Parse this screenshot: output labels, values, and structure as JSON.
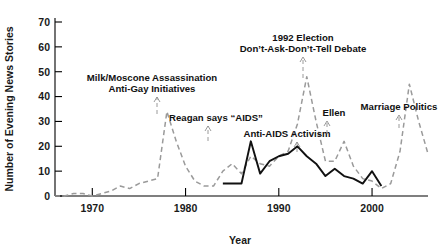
{
  "chart_data": {
    "type": "line",
    "title": "",
    "xlabel": "Year",
    "ylabel": "Number of Evening News Stories",
    "xlim": [
      1966,
      2006
    ],
    "ylim": [
      0,
      70
    ],
    "grid": false,
    "legend_position": "none",
    "x_ticks": [
      1970,
      1980,
      1990,
      2000
    ],
    "x_tick_labels": [
      "1970",
      "1980",
      "1990",
      "2000"
    ],
    "y_ticks": [
      0,
      10,
      20,
      30,
      40,
      50,
      60,
      70
    ],
    "y_tick_labels": [
      "0",
      "10",
      "20",
      "30",
      "40",
      "50",
      "60",
      "70"
    ],
    "series": [
      {
        "name": "Gay rights / general coverage",
        "style": "dashed",
        "color": "#9a9a9a",
        "x": [
          1966,
          1967,
          1968,
          1969,
          1970,
          1971,
          1972,
          1973,
          1974,
          1975,
          1976,
          1977,
          1978,
          1979,
          1980,
          1981,
          1982,
          1983,
          1984,
          1985,
          1986,
          1987,
          1988,
          1989,
          1990,
          1991,
          1992,
          1993,
          1994,
          1995,
          1996,
          1997,
          1998,
          1999,
          2000,
          2001,
          2002,
          2003,
          2004,
          2005,
          2006
        ],
        "y": [
          0,
          0,
          1,
          1,
          0,
          1,
          2,
          4,
          3,
          5,
          6,
          7,
          34,
          22,
          12,
          6,
          4,
          4,
          10,
          13,
          9,
          16,
          13,
          12,
          16,
          18,
          29,
          48,
          30,
          14,
          14,
          22,
          12,
          7,
          6,
          3,
          5,
          18,
          45,
          30,
          17
        ]
      },
      {
        "name": "AIDS coverage",
        "style": "solid",
        "color": "#111111",
        "x": [
          1984,
          1985,
          1986,
          1987,
          1988,
          1989,
          1990,
          1991,
          1992,
          1993,
          1994,
          1995,
          1996,
          1997,
          1998,
          1999,
          2000,
          2001
        ],
        "y": [
          5,
          5,
          5,
          22,
          9,
          14,
          16,
          17,
          20,
          16,
          13,
          8,
          11,
          8,
          7,
          5,
          10,
          4
        ]
      }
    ],
    "annotations": [
      {
        "id": "milk-moscone",
        "lines": [
          "Milk/Moscone Assassination",
          "Anti-Gay Initiatives"
        ],
        "text_x": 152,
        "text_y": 92,
        "target_x": 157,
        "target_y": 114
      },
      {
        "id": "reagan-aids",
        "lines": [
          "Reagan says “AIDS”"
        ],
        "text_x": 216,
        "text_y": 121,
        "target_x": 208,
        "target_y": 141
      },
      {
        "id": "1992-election",
        "lines": [
          "1992 Election",
          "Don’t-Ask-Don’t-Tell Debate"
        ],
        "text_x": 303,
        "text_y": 52,
        "target_x": 303,
        "target_y": 78
      },
      {
        "id": "anti-aids-activism",
        "lines": [
          "Anti-AIDS Activism"
        ],
        "text_x": 287,
        "text_y": 137,
        "target_x": 297,
        "target_y": 152
      },
      {
        "id": "ellen",
        "lines": [
          "Ellen"
        ],
        "text_x": 334,
        "text_y": 116,
        "target_x": 327,
        "target_y": 134
      },
      {
        "id": "marriage-politics",
        "lines": [
          "Marriage Politics"
        ],
        "text_x": 399,
        "text_y": 110,
        "target_x": 399,
        "target_y": 128
      }
    ]
  }
}
